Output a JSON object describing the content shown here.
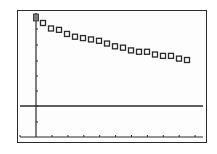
{
  "chart_data": {
    "type": "scatter",
    "title": "",
    "xlabel": "",
    "ylabel": "",
    "grid": false,
    "legend": null,
    "marker": "hollow-square",
    "axis_style": "graphing-calculator",
    "x": [
      1,
      2,
      3,
      4,
      5,
      6,
      7,
      8,
      9,
      10,
      11,
      12,
      13,
      14,
      15,
      16,
      17,
      18,
      19
    ],
    "y": [
      10.8,
      10.4,
      10.3,
      10.0,
      9.8,
      9.7,
      9.6,
      9.5,
      9.3,
      9.1,
      9.0,
      8.8,
      8.7,
      8.7,
      8.5,
      8.4,
      8.4,
      8.2,
      8.1
    ],
    "x_ticks_count": 10,
    "y_ticks_count": 7,
    "horizontal_reference_line": true,
    "cursor_at_y_axis_top": true
  },
  "colors": {
    "background": "#fdfdfd",
    "ink": "#2b2b2b"
  }
}
